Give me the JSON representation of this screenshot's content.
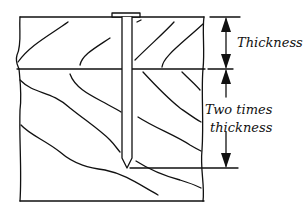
{
  "diagram": {
    "labels": {
      "top_dimension": "Thickness",
      "bottom_dimension_line1": "Two times",
      "bottom_dimension_line2": "thickness"
    },
    "parts": {
      "top_board": "top board",
      "bottom_board": "bottom board",
      "nail": "nail"
    },
    "colors": {
      "ink": "#111111",
      "background": "#ffffff"
    }
  }
}
